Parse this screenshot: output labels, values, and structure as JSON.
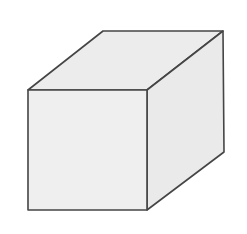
{
  "diagram": {
    "type": "isometric-cube",
    "colors": {
      "background": "#ffffff",
      "stroke": "#454545",
      "front_face": "#efefef",
      "top_face": "#ececec",
      "side_face": "#eaeaea"
    },
    "stroke_width": 1.6,
    "vertices": {
      "front_top_left": [
        28,
        90
      ],
      "front_top_right": [
        147,
        90
      ],
      "front_bottom_right": [
        147,
        210
      ],
      "front_bottom_left": [
        28,
        210
      ],
      "back_top_left": [
        103,
        31
      ],
      "back_top_right": [
        223,
        31
      ],
      "back_bottom_right": [
        224,
        152
      ]
    }
  }
}
